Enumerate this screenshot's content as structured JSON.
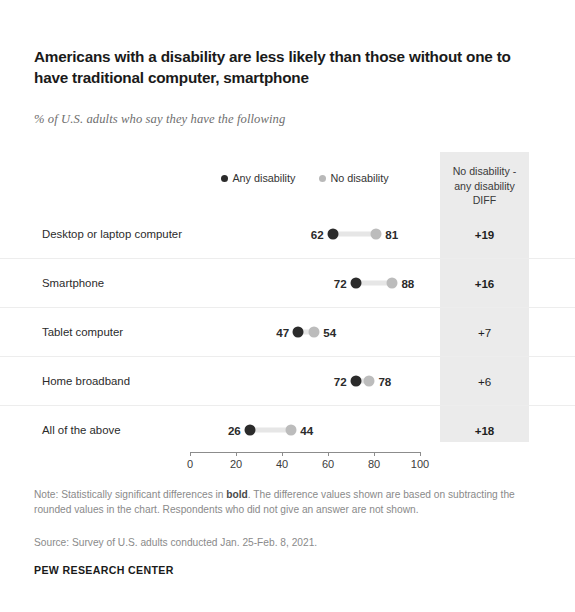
{
  "title": "Americans with a disability are less likely than those without one to have traditional computer, smartphone",
  "subtitle": "% of U.S. adults who say they have the following",
  "legend": {
    "any_label": "Any disability",
    "no_label": "No disability"
  },
  "diff_column": {
    "header_line1": "No disability -",
    "header_line2": "any disability",
    "header_line3": "DIFF"
  },
  "footer": {
    "note_prefix": "Note: Statistically significant differences in ",
    "note_bold": "bold",
    "note_suffix": ". The difference values shown are based on subtracting the rounded values in the chart. Respondents who did not give an answer are not shown.",
    "source": "Source: Survey of U.S. adults conducted Jan. 25-Feb. 8, 2021.",
    "brand": "PEW RESEARCH CENTER"
  },
  "chart_data": {
    "type": "scatter",
    "title": "Americans with a disability are less likely than those without one to have traditional computer, smartphone",
    "subtitle": "% of U.S. adults who say they have the following",
    "xlabel": "",
    "ylabel": "",
    "xlim": [
      0,
      100
    ],
    "xticks": [
      0,
      20,
      40,
      60,
      80,
      100
    ],
    "xtick_labels": [
      "0",
      "20",
      "40",
      "60",
      "80",
      "100"
    ],
    "grid": false,
    "legend_position": "top-center",
    "colors": {
      "any_disability": "#2b2b2b",
      "no_disability": "#bcbcbc",
      "diff_band": "#ebebeb"
    },
    "categories": [
      "Desktop or laptop computer",
      "Smartphone",
      "Tablet computer",
      "Home broadband",
      "All of the above"
    ],
    "series": [
      {
        "name": "Any disability",
        "values": [
          62,
          72,
          47,
          72,
          26
        ]
      },
      {
        "name": "No disability",
        "values": [
          81,
          88,
          54,
          78,
          44
        ]
      }
    ],
    "diff": [
      {
        "value": "+19",
        "significant": true
      },
      {
        "value": "+16",
        "significant": true
      },
      {
        "value": "+7",
        "significant": false
      },
      {
        "value": "+6",
        "significant": false
      },
      {
        "value": "+18",
        "significant": true
      }
    ],
    "rows": [
      {
        "label": "Desktop or laptop computer",
        "any": 62,
        "no": 81,
        "diff": "+19",
        "significant": true
      },
      {
        "label": "Smartphone",
        "any": 72,
        "no": 88,
        "diff": "+16",
        "significant": true
      },
      {
        "label": "Tablet computer",
        "any": 47,
        "no": 54,
        "diff": "+7",
        "significant": false
      },
      {
        "label": "Home broadband",
        "any": 72,
        "no": 78,
        "diff": "+6",
        "significant": false
      },
      {
        "label": "All of the above",
        "any": 26,
        "no": 44,
        "diff": "+18",
        "significant": true
      }
    ]
  }
}
